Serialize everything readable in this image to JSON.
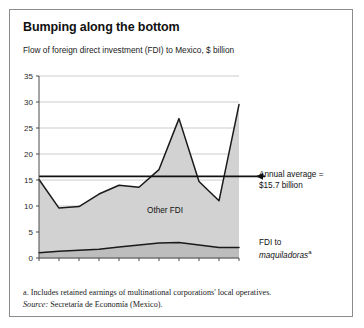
{
  "title": "Bumping along the bottom",
  "subtitle": "Flow of foreign direct investment (FDI) to Mexico, $ billion",
  "annotations": {
    "average_line1": "Annual average =",
    "average_line2": "$15.7 billion",
    "maquila_line1": "FDI to",
    "maquila_line2": "maquiladoras",
    "maquila_sup": "a",
    "other_fdi": "Other FDI"
  },
  "footnotes": {
    "note_a": "a. Includes retained earnings of multinational corporations' local operatives.",
    "source_label": "Source:",
    "source_text": "Secretaría de Economía (Mexico)."
  },
  "colors": {
    "frame": "#8c8c8c",
    "area_fill": "#d2d2d2",
    "line": "#1a1a1a",
    "grid": "#b5b5b5",
    "text": "#111111"
  },
  "chart_data": {
    "type": "area",
    "title": "Bumping along the bottom",
    "subtitle": "Flow of foreign direct investment (FDI) to Mexico, $ billion",
    "xlabel": "",
    "ylabel": "$ billion",
    "ylim": [
      0,
      35
    ],
    "ytick_values": [
      0,
      5,
      10,
      15,
      20,
      25,
      30,
      35
    ],
    "ytick_labels": [
      "0",
      "5",
      "10",
      "15",
      "20",
      "25",
      "30",
      "35"
    ],
    "grid": true,
    "legend": "inline-labels",
    "x": [
      1994,
      1995,
      1996,
      1997,
      1998,
      1999,
      2000,
      2001,
      2002,
      2003,
      2004
    ],
    "xtick_labels": [
      "1994",
      "",
      "1996",
      "",
      "1998",
      "",
      "2000",
      "",
      "2002",
      "",
      "2004"
    ],
    "stacked": true,
    "series": [
      {
        "name": "FDI to maquiladoras",
        "values": [
          1.0,
          1.3,
          1.5,
          1.7,
          2.1,
          2.5,
          2.9,
          3.0,
          2.5,
          2.0,
          2.0
        ]
      },
      {
        "name": "Other FDI",
        "values": [
          14.1,
          8.3,
          8.4,
          10.6,
          11.9,
          11.1,
          14.1,
          23.8,
          12.2,
          9.0,
          27.5
        ]
      }
    ],
    "total_fdi": [
      15.1,
      9.6,
      9.9,
      12.3,
      14.0,
      13.6,
      17.0,
      26.8,
      14.7,
      11.0,
      29.5
    ],
    "reference_line": {
      "label": "Annual average = $15.7 billion",
      "value": 15.7
    }
  }
}
